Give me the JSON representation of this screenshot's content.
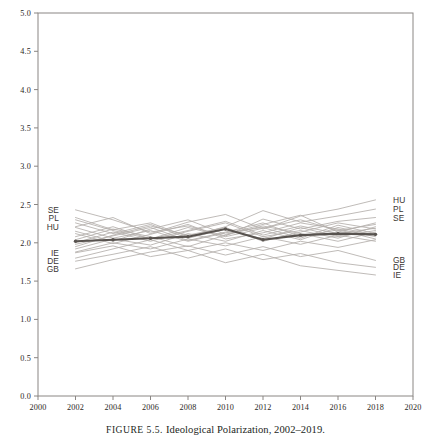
{
  "caption": {
    "figure_number": "FIGURE 5.5.",
    "text": "Ideological Polarization, 2002–2019."
  },
  "chart_data": {
    "type": "line",
    "title": "",
    "subtitle": "",
    "xlabel": "",
    "ylabel": "",
    "xlim": [
      2000,
      2020
    ],
    "ylim": [
      0.0,
      5.0
    ],
    "xticks": [
      2000,
      2002,
      2004,
      2006,
      2008,
      2010,
      2012,
      2014,
      2016,
      2018,
      2020
    ],
    "xtick_labels": [
      "2000",
      "2002",
      "2004",
      "2006",
      "2008",
      "2010",
      "2012",
      "2014",
      "2016",
      "2018",
      "2020"
    ],
    "yticks": [
      0.0,
      0.5,
      1.0,
      1.5,
      2.0,
      2.5,
      3.0,
      3.5,
      4.0,
      4.5,
      5.0
    ],
    "ytick_labels": [
      "0.0",
      "0.5",
      "1.0",
      "1.5",
      "2.0",
      "2.5",
      "3.0",
      "3.5",
      "4.0",
      "4.5",
      "5.0"
    ],
    "grid": false,
    "legend": "none",
    "label_position": "line-ends",
    "x": [
      2002,
      2004,
      2006,
      2008,
      2010,
      2012,
      2014,
      2016,
      2018
    ],
    "left_labels": [
      {
        "name": "SE",
        "value": 2.43
      },
      {
        "name": "PL",
        "value": 2.33
      },
      {
        "name": "HU",
        "value": 2.21
      },
      {
        "name": "IE",
        "value": 1.87
      },
      {
        "name": "DE",
        "value": 1.76
      },
      {
        "name": "GB",
        "value": 1.66
      }
    ],
    "right_labels": [
      {
        "name": "HU",
        "value": 2.56
      },
      {
        "name": "PL",
        "value": 2.44
      },
      {
        "name": "SE",
        "value": 2.33
      },
      {
        "name": "GB",
        "value": 1.77
      },
      {
        "name": "DE",
        "value": 1.68
      },
      {
        "name": "IE",
        "value": 1.58
      }
    ],
    "series": [
      {
        "name": "SE",
        "highlight": false,
        "values": [
          2.43,
          2.3,
          2.14,
          2.22,
          2.09,
          2.31,
          2.18,
          2.28,
          2.33
        ]
      },
      {
        "name": "PL",
        "highlight": false,
        "values": [
          2.33,
          2.17,
          2.26,
          2.08,
          2.21,
          2.42,
          2.27,
          2.35,
          2.44
        ]
      },
      {
        "name": "HU",
        "highlight": false,
        "values": [
          2.21,
          2.33,
          2.12,
          2.27,
          2.37,
          2.18,
          2.35,
          2.44,
          2.56
        ]
      },
      {
        "name": "IE",
        "highlight": false,
        "values": [
          1.87,
          1.96,
          1.82,
          1.9,
          1.74,
          1.85,
          1.7,
          1.64,
          1.58
        ]
      },
      {
        "name": "DE",
        "highlight": false,
        "values": [
          1.76,
          1.85,
          1.95,
          1.8,
          1.92,
          1.78,
          1.86,
          1.74,
          1.68
        ]
      },
      {
        "name": "GB",
        "highlight": false,
        "values": [
          1.66,
          1.78,
          1.88,
          1.96,
          1.84,
          1.95,
          1.82,
          1.9,
          1.77
        ]
      },
      {
        "name": "AT",
        "highlight": false,
        "values": [
          2.08,
          2.21,
          2.05,
          2.16,
          2.28,
          2.1,
          2.22,
          2.12,
          2.19
        ]
      },
      {
        "name": "BE",
        "highlight": false,
        "values": [
          1.98,
          2.09,
          2.2,
          2.03,
          2.14,
          2.26,
          2.08,
          2.17,
          2.05
        ]
      },
      {
        "name": "CH",
        "highlight": false,
        "values": [
          2.15,
          2.02,
          2.18,
          2.3,
          2.11,
          2.24,
          2.36,
          2.14,
          2.26
        ]
      },
      {
        "name": "CZ",
        "highlight": false,
        "values": [
          1.92,
          2.05,
          1.97,
          2.12,
          2.02,
          2.16,
          2.04,
          2.2,
          2.1
        ]
      },
      {
        "name": "DK",
        "highlight": false,
        "values": [
          2.26,
          2.12,
          2.24,
          2.06,
          2.18,
          2.05,
          2.2,
          2.08,
          2.16
        ]
      },
      {
        "name": "ES",
        "highlight": false,
        "values": [
          2.04,
          2.18,
          2.08,
          1.95,
          2.1,
          2.22,
          2.12,
          2.02,
          2.14
        ]
      },
      {
        "name": "FI",
        "highlight": false,
        "values": [
          2.12,
          1.99,
          2.11,
          2.24,
          2.05,
          2.13,
          2.26,
          2.18,
          2.08
        ]
      },
      {
        "name": "FR",
        "highlight": false,
        "values": [
          2.0,
          2.14,
          2.02,
          2.15,
          2.26,
          2.08,
          2.16,
          2.06,
          2.21
        ]
      },
      {
        "name": "NL",
        "highlight": false,
        "values": [
          2.2,
          2.06,
          2.16,
          2.02,
          2.13,
          2.2,
          2.06,
          2.23,
          2.12
        ]
      },
      {
        "name": "NO",
        "highlight": false,
        "values": [
          1.95,
          2.1,
          2.22,
          2.1,
          2.2,
          2.02,
          2.14,
          2.26,
          2.18
        ]
      },
      {
        "name": "PT",
        "highlight": false,
        "values": [
          1.88,
          2.0,
          1.92,
          2.05,
          1.96,
          2.08,
          1.98,
          2.1,
          2.02
        ]
      },
      {
        "name": "SI",
        "highlight": false,
        "values": [
          2.3,
          2.16,
          2.05,
          2.2,
          2.08,
          2.19,
          2.3,
          2.16,
          2.24
        ]
      },
      {
        "name": "EE",
        "highlight": false,
        "values": [
          1.8,
          1.92,
          2.04,
          1.9,
          2.0,
          1.9,
          2.02,
          1.94,
          2.04
        ]
      },
      {
        "name": "AVG",
        "highlight": true,
        "values": [
          2.02,
          2.04,
          2.06,
          2.08,
          2.18,
          2.04,
          2.1,
          2.12,
          2.11
        ]
      }
    ]
  }
}
